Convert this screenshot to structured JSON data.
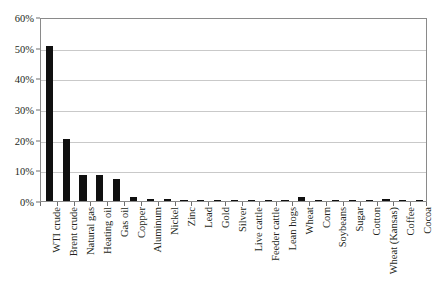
{
  "chart_data": {
    "type": "bar",
    "title": "",
    "subtitle": "",
    "xlabel": "",
    "ylabel": "",
    "ylim": [
      0,
      60
    ],
    "y_tick_values": [
      0,
      10,
      20,
      30,
      40,
      50,
      60
    ],
    "y_tick_labels": [
      "0%",
      "10%",
      "20%",
      "30%",
      "40%",
      "50%",
      "60%"
    ],
    "y_unit": "%",
    "grid": "horizontal",
    "legend": "none",
    "bar_color": "#101010",
    "grid_color": "#c9c9c9",
    "frame_color": "#8a8a8a",
    "background_color": "#ffffff",
    "categories": [
      "WTI crude",
      "Brent crude",
      "Natural gas",
      "Heating oil",
      "Gas oil",
      "Copper",
      "Aluminum",
      "Nickel",
      "Zinc",
      "Lead",
      "Gold",
      "Silver",
      "Live cattle",
      "Feeder cattle",
      "Lean hogs",
      "Wheat",
      "Corn",
      "Soybeans",
      "Sugar",
      "Cotton",
      "Wheat (Kansas)",
      "Coffee",
      "Cocoa"
    ],
    "values": [
      50.7,
      20.2,
      8.6,
      8.6,
      7.3,
      1.3,
      0.6,
      0.5,
      0.3,
      0.3,
      0.3,
      0.3,
      0.2,
      0.2,
      0.2,
      1.2,
      0.4,
      0.3,
      0.3,
      0.2,
      0.6,
      0.2,
      0.2
    ]
  }
}
